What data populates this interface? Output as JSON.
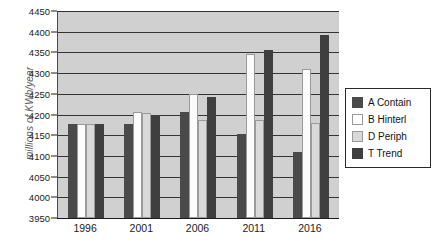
{
  "chart_data": {
    "type": "bar",
    "title": "",
    "subtitle": "",
    "xlabel": "",
    "ylabel": "millions of KWh/year",
    "categories": [
      "1996",
      "2001",
      "2006",
      "2011",
      "2016"
    ],
    "ylim": [
      3950,
      4450
    ],
    "ytick_step": 50,
    "yticks": [
      "3950",
      "4000",
      "4050",
      "4100",
      "4150",
      "4200",
      "4250",
      "4300",
      "4350",
      "4400",
      "4450"
    ],
    "grid": true,
    "legend_position": "right",
    "series": [
      {
        "name": "A Contain",
        "swatch": "s-dark",
        "color": "#4a4a4a",
        "values": [
          4178,
          4178,
          4205,
          4152,
          4110
        ]
      },
      {
        "name": "B Hinterl",
        "swatch": "s-white",
        "color": "#fbfbfb",
        "values": [
          4178,
          4205,
          4250,
          4345,
          4310
        ]
      },
      {
        "name": "D Periph",
        "swatch": "s-light",
        "color": "#d9d9d9",
        "values": [
          4178,
          4203,
          4186,
          4186,
          4180
        ]
      },
      {
        "name": "T Trend",
        "swatch": "s-dark2",
        "color": "#3f3f3f",
        "values": [
          4178,
          4200,
          4242,
          4355,
          4393
        ]
      }
    ]
  },
  "legend": {
    "items": [
      {
        "label": "A Contain",
        "swatch": "s-dark"
      },
      {
        "label": "B Hinterl",
        "swatch": "s-white"
      },
      {
        "label": "D Periph",
        "swatch": "s-light"
      },
      {
        "label": "T Trend",
        "swatch": "s-dark2"
      }
    ]
  }
}
